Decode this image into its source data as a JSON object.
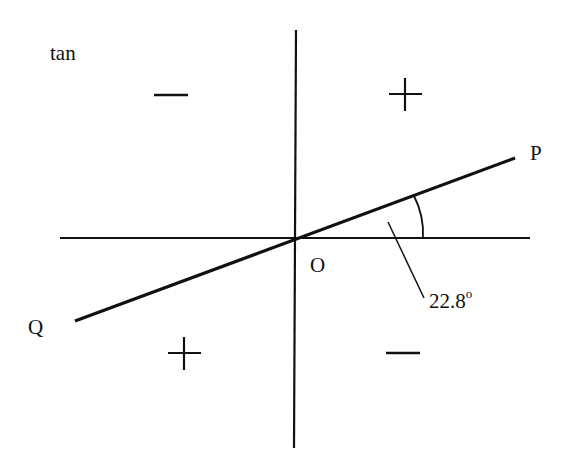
{
  "diagram": {
    "function_label": "tan",
    "quadrant_signs": {
      "top_left": "−",
      "top_right": "+",
      "bottom_left": "+",
      "bottom_right": "−"
    },
    "origin_label": "O",
    "point_p_label": "P",
    "point_q_label": "Q",
    "angle_value": "22.8",
    "angle_unit": "o",
    "colors": {
      "ink": "#111111",
      "background": "#ffffff"
    }
  }
}
